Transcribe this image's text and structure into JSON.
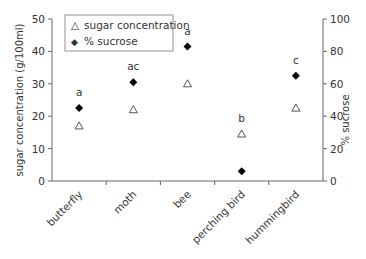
{
  "chart_data": {
    "type": "scatter",
    "title": "",
    "categories": [
      "butterfly",
      "moth",
      "bee",
      "perching bird",
      "hummingbird"
    ],
    "series": [
      {
        "name": "sugar concentration",
        "axis": "left",
        "marker": "open-triangle",
        "values": [
          17,
          22,
          30,
          14.5,
          22.5
        ]
      },
      {
        "name": "% sucrose",
        "axis": "right",
        "marker": "filled-diamond",
        "values": [
          45,
          61,
          83,
          6,
          65
        ]
      }
    ],
    "significance_labels": [
      "a",
      "ac",
      "a",
      "b",
      "c"
    ],
    "left_axis": {
      "label": "sugar concentration (g/100ml)",
      "ylim": [
        0,
        50
      ],
      "ticks": [
        "0",
        "10",
        "20",
        "30",
        "40",
        "50"
      ]
    },
    "right_axis": {
      "label": "% sucrose",
      "ylim": [
        0,
        100
      ],
      "ticks": [
        "0",
        "20",
        "40",
        "60",
        "80",
        "100"
      ]
    },
    "legend": {
      "placement": "top-left",
      "entries": [
        {
          "symbol": "△",
          "label": "sugar concentration"
        },
        {
          "symbol": "◆",
          "label": "% sucrose"
        }
      ]
    },
    "grid": false
  }
}
